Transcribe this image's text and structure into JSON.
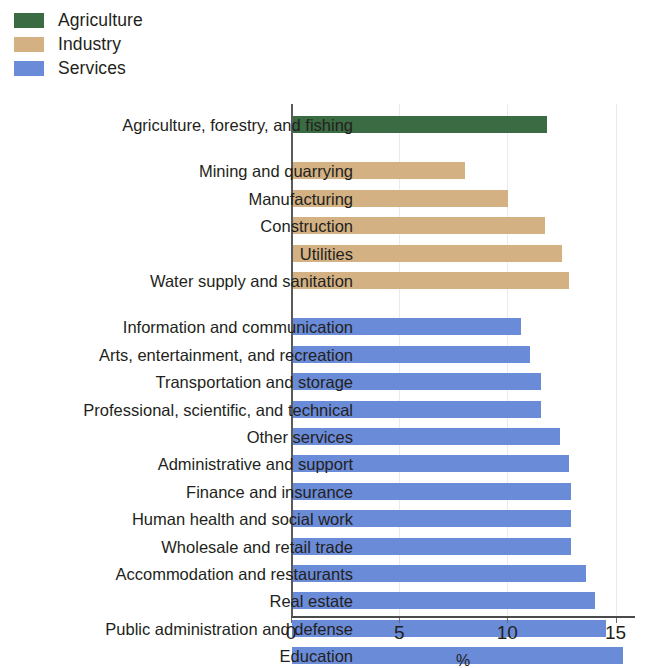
{
  "legend": {
    "items": [
      {
        "label": "Agriculture",
        "color": "#3a6b42"
      },
      {
        "label": "Industry",
        "color": "#d3b183"
      },
      {
        "label": "Services",
        "color": "#6a8bd8"
      }
    ]
  },
  "axis": {
    "x_label": "%",
    "x_ticks": [
      "0",
      "5",
      "10",
      "15"
    ],
    "x_tick_values": [
      0,
      5,
      10,
      15
    ],
    "x_min": 0,
    "x_max": 15.9
  },
  "chart_data": {
    "type": "bar",
    "orientation": "horizontal",
    "title": "",
    "xlabel": "%",
    "ylabel": "",
    "xlim": [
      0,
      15.9
    ],
    "grid": true,
    "legend_position": "top-left",
    "categories": [
      "Agriculture, forestry, and fishing",
      "Mining and quarrying",
      "Manufacturing",
      "Construction",
      "Utilities",
      "Water supply and sanitation",
      "Information and communication",
      "Arts, entertainment, and recreation",
      "Transportation and storage",
      "Professional, scientific, and technical",
      "Other services",
      "Administrative and support",
      "Finance and insurance",
      "Human health and social work",
      "Wholesale and retail trade",
      "Accommodation and restaurants",
      "Real estate",
      "Public administration and defense",
      "Education"
    ],
    "values": [
      11.8,
      8.0,
      10.0,
      11.7,
      12.5,
      12.8,
      10.6,
      11.0,
      11.5,
      11.5,
      12.4,
      12.8,
      12.9,
      12.9,
      12.9,
      13.6,
      14.0,
      14.5,
      15.3
    ],
    "groups": [
      {
        "name": "Agriculture",
        "color": "#3a6b42",
        "count": 1
      },
      {
        "name": "Industry",
        "color": "#d3b183",
        "count": 5
      },
      {
        "name": "Services",
        "color": "#6a8bd8",
        "count": 13
      }
    ],
    "series": [
      {
        "name": "Share of employment",
        "values": [
          11.8,
          8.0,
          10.0,
          11.7,
          12.5,
          12.8,
          10.6,
          11.0,
          11.5,
          11.5,
          12.4,
          12.8,
          12.9,
          12.9,
          12.9,
          13.6,
          14.0,
          14.5,
          15.3
        ]
      }
    ]
  }
}
